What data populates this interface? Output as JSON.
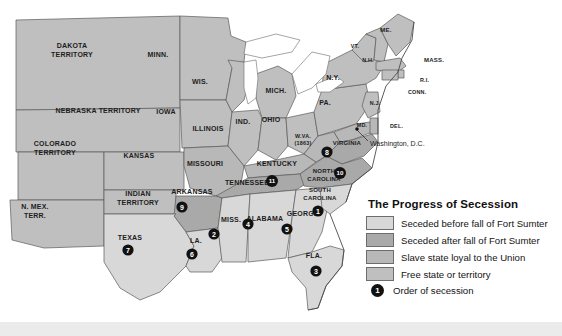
{
  "map": {
    "title_hidden": "",
    "states": [
      {
        "id": "dakota-territory",
        "label": "DAKOTA\nTERRITORY",
        "category": "free"
      },
      {
        "id": "minnesota",
        "label": "MINN.",
        "category": "free"
      },
      {
        "id": "wisconsin",
        "label": "WIS.",
        "category": "free"
      },
      {
        "id": "michigan",
        "label": "MICH.",
        "category": "free"
      },
      {
        "id": "nebraska-territory",
        "label": "NEBRASKA TERRITORY",
        "category": "free"
      },
      {
        "id": "iowa",
        "label": "IOWA",
        "category": "free"
      },
      {
        "id": "illinois",
        "label": "ILLINOIS",
        "category": "free"
      },
      {
        "id": "indiana",
        "label": "IND.",
        "category": "free"
      },
      {
        "id": "ohio",
        "label": "OHIO",
        "category": "free"
      },
      {
        "id": "pennsylvania",
        "label": "PA.",
        "category": "free"
      },
      {
        "id": "new-york",
        "label": "N.Y.",
        "category": "free"
      },
      {
        "id": "vermont",
        "label": "VT.",
        "category": "free"
      },
      {
        "id": "new-hampshire",
        "label": "N.H.",
        "category": "free"
      },
      {
        "id": "maine",
        "label": "ME.",
        "category": "free"
      },
      {
        "id": "massachusetts",
        "label": "MASS.",
        "category": "free"
      },
      {
        "id": "rhode-island",
        "label": "R.I.",
        "category": "free"
      },
      {
        "id": "connecticut",
        "label": "CONN.",
        "category": "free"
      },
      {
        "id": "new-jersey",
        "label": "N.J.",
        "category": "free"
      },
      {
        "id": "delaware",
        "label": "DEL.",
        "category": "loyal"
      },
      {
        "id": "maryland",
        "label": "MD.",
        "category": "loyal"
      },
      {
        "id": "colorado-territory",
        "label": "COLORADO\nTERRITORY",
        "category": "free"
      },
      {
        "id": "kansas",
        "label": "KANSAS",
        "category": "free"
      },
      {
        "id": "missouri",
        "label": "MISSOURI",
        "category": "loyal"
      },
      {
        "id": "kentucky",
        "label": "KENTUCKY",
        "category": "loyal"
      },
      {
        "id": "west-virginia",
        "label": "W.VA.\n(1863)",
        "category": "loyal"
      },
      {
        "id": "virginia",
        "label": "VIRGINIA",
        "category": "after"
      },
      {
        "id": "north-carolina",
        "label": "NORTH\nCAROLINA",
        "category": "after"
      },
      {
        "id": "tennessee",
        "label": "TENNESSEE",
        "category": "after"
      },
      {
        "id": "arkansas",
        "label": "ARKANSAS",
        "category": "after"
      },
      {
        "id": "south-carolina",
        "label": "SOUTH\nCAROLINA",
        "category": "before"
      },
      {
        "id": "georgia",
        "label": "GEORGIA",
        "category": "before"
      },
      {
        "id": "alabama",
        "label": "ALABAMA",
        "category": "before"
      },
      {
        "id": "mississippi",
        "label": "MISS.",
        "category": "before"
      },
      {
        "id": "louisiana",
        "label": "LA.",
        "category": "before"
      },
      {
        "id": "florida",
        "label": "FLA.",
        "category": "before"
      },
      {
        "id": "texas",
        "label": "TEXAS",
        "category": "before"
      },
      {
        "id": "indian-territory",
        "label": "INDIAN\nTERRITORY",
        "category": "free"
      },
      {
        "id": "new-mexico-territory",
        "label": "N. MEX.\nTERR.",
        "category": "free"
      }
    ],
    "city": {
      "label": "Washington, D.C."
    },
    "secession_order": [
      {
        "n": "1",
        "state": "south-carolina"
      },
      {
        "n": "2",
        "state": "mississippi"
      },
      {
        "n": "3",
        "state": "florida"
      },
      {
        "n": "4",
        "state": "alabama"
      },
      {
        "n": "5",
        "state": "georgia"
      },
      {
        "n": "6",
        "state": "louisiana"
      },
      {
        "n": "7",
        "state": "texas"
      },
      {
        "n": "8",
        "state": "virginia"
      },
      {
        "n": "9",
        "state": "arkansas"
      },
      {
        "n": "10",
        "state": "north-carolina"
      },
      {
        "n": "11",
        "state": "tennessee"
      }
    ]
  },
  "legend": {
    "title": "The Progress of Secession",
    "items": [
      {
        "key": "before",
        "label": "Seceded before fall of Fort Sumter",
        "color": "#d8d8d8"
      },
      {
        "key": "after",
        "label": "Seceded after fall of Fort Sumter",
        "color": "#a9a9a9"
      },
      {
        "key": "loyal",
        "label": "Slave state loyal to the Union",
        "color": "#b8b8b8"
      },
      {
        "key": "free",
        "label": "Free state or territory",
        "color": "#bfbfbf"
      }
    ],
    "order_marker": "1",
    "order_label": "Order of secession"
  }
}
